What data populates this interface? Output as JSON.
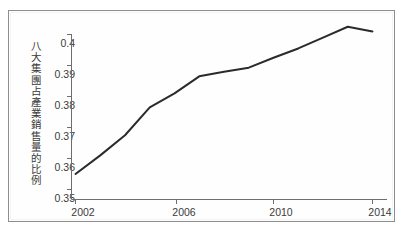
{
  "figure": {
    "background_color": "#ffffff",
    "frame_color": "#8d8d8d",
    "line_color": "#2b2b2b",
    "axis_color": "#6e6e6e"
  },
  "chart_data": {
    "type": "line",
    "title": "",
    "subtitle": "",
    "xlabel": "",
    "ylabel": "八大集團占產業銷售量的比例",
    "xlim": [
      2001.5,
      2014.5
    ],
    "ylim": [
      0.35,
      0.404
    ],
    "grid": false,
    "legend": null,
    "x_tick_labels": [
      "2002",
      "2006",
      "2010",
      "2014"
    ],
    "x_ticks": [
      2002,
      2006,
      2010,
      2014
    ],
    "y_tick_labels": [
      "0.35",
      "0.36",
      "0.37",
      "0.38",
      "0.39",
      "0.4"
    ],
    "y_ticks": [
      0.35,
      0.36,
      0.37,
      0.38,
      0.39,
      0.4
    ],
    "series": [
      {
        "name": "八大集團占產業銷售量的比例",
        "x": [
          2002,
          2003,
          2004,
          2005,
          2006,
          2007,
          2008,
          2009,
          2010,
          2011,
          2012,
          2013,
          2014
        ],
        "values": [
          0.355,
          0.361,
          0.3675,
          0.3765,
          0.381,
          0.3865,
          0.388,
          0.3893,
          0.3925,
          0.3955,
          0.399,
          0.4025,
          0.401
        ]
      }
    ],
    "annotations": []
  }
}
